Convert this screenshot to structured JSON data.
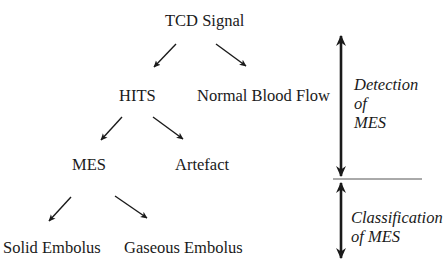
{
  "diagram": {
    "type": "tree",
    "nodes": {
      "root": "TCD Signal",
      "hits": "HITS",
      "normal_blood_flow": "Normal Blood Flow",
      "mes": "MES",
      "artefact": "Artefact",
      "solid_embolus": "Solid Embolus",
      "gaseous_embolus": "Gaseous Embolus"
    },
    "edges": [
      {
        "from": "TCD Signal",
        "to": "HITS"
      },
      {
        "from": "TCD Signal",
        "to": "Normal Blood Flow"
      },
      {
        "from": "HITS",
        "to": "MES"
      },
      {
        "from": "HITS",
        "to": "Artefact"
      },
      {
        "from": "MES",
        "to": "Solid Embolus"
      },
      {
        "from": "MES",
        "to": "Gaseous Embolus"
      }
    ],
    "stages": {
      "detection": {
        "line1": "Detection",
        "line2": "of",
        "line3": "MES"
      },
      "classification": {
        "line1": "Classification",
        "line2": "of MES"
      }
    },
    "colors": {
      "stroke": "#1a1a1a",
      "divider": "#555555",
      "background": "#ffffff"
    }
  }
}
